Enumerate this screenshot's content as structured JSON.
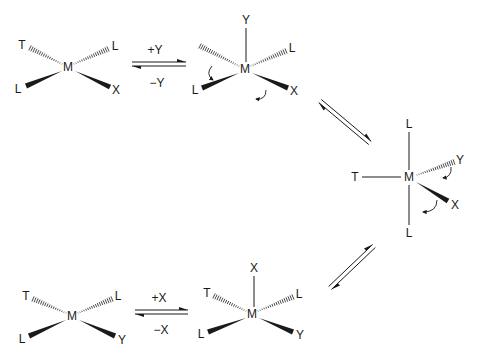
{
  "colors": {
    "ink": "#1a1a1a",
    "background": "#ffffff"
  },
  "structures": [
    {
      "id": "square-planar-1",
      "center": {
        "label": "M",
        "x": 68,
        "y": 67
      },
      "ligands": [
        {
          "label": "T",
          "x": 22,
          "y": 45,
          "bond": "hash",
          "from": [
            30,
            48
          ],
          "to": [
            62,
            64
          ]
        },
        {
          "label": "L",
          "x": 115,
          "y": 46,
          "bond": "hash",
          "from": [
            74,
            64
          ],
          "to": [
            108,
            49
          ]
        },
        {
          "label": "L",
          "x": 18,
          "y": 89,
          "bond": "wedge",
          "from": [
            62,
            71
          ],
          "to": [
            26,
            86
          ]
        },
        {
          "label": "X",
          "x": 116,
          "y": 90,
          "bond": "wedge",
          "from": [
            75,
            71
          ],
          "to": [
            110,
            87
          ]
        }
      ],
      "curved_arrows": []
    },
    {
      "id": "five-coordinate-2",
      "center": {
        "label": "M",
        "x": 245,
        "y": 69
      },
      "ligands": [
        {
          "label": "Y",
          "x": 246,
          "y": 20,
          "bond": "line",
          "from": [
            246,
            28
          ],
          "to": [
            246,
            62
          ]
        },
        {
          "label": "",
          "x": 200,
          "y": 47,
          "bond": "hash",
          "from": [
            200,
            46
          ],
          "to": [
            239,
            66
          ]
        },
        {
          "label": "L",
          "x": 292,
          "y": 48,
          "bond": "hash",
          "from": [
            251,
            66
          ],
          "to": [
            286,
            51
          ]
        },
        {
          "label": "L",
          "x": 195,
          "y": 90,
          "bond": "wedge",
          "from": [
            239,
            73
          ],
          "to": [
            202,
            88
          ]
        },
        {
          "label": "X",
          "x": 294,
          "y": 91,
          "bond": "wedge",
          "from": [
            252,
            73
          ],
          "to": [
            288,
            88
          ]
        }
      ],
      "curved_arrows": [
        {
          "path": "M 212 66 Q 205 74 213 80",
          "head": [
            213,
            80
          ]
        },
        {
          "path": "M 266 90 Q 266 100 256 99",
          "head": [
            256,
            99
          ]
        }
      ]
    },
    {
      "id": "trigonal-bipyramidal-3",
      "center": {
        "label": "M",
        "x": 409,
        "y": 177
      },
      "ligands": [
        {
          "label": "L",
          "x": 409,
          "y": 124,
          "bond": "line",
          "from": [
            409,
            132
          ],
          "to": [
            409,
            170
          ]
        },
        {
          "label": "T",
          "x": 355,
          "y": 177,
          "bond": "line",
          "from": [
            362,
            177
          ],
          "to": [
            401,
            177
          ]
        },
        {
          "label": "Y",
          "x": 460,
          "y": 160,
          "bond": "hash",
          "from": [
            417,
            175
          ],
          "to": [
            454,
            162
          ]
        },
        {
          "label": "X",
          "x": 455,
          "y": 205,
          "bond": "wedge",
          "from": [
            416,
            182
          ],
          "to": [
            448,
            201
          ]
        },
        {
          "label": "L",
          "x": 409,
          "y": 233,
          "bond": "line",
          "from": [
            409,
            185
          ],
          "to": [
            409,
            225
          ]
        }
      ],
      "curved_arrows": [
        {
          "path": "M 451 167 Q 452 177 443 178",
          "head": [
            443,
            178
          ]
        },
        {
          "path": "M 437 200 Q 437 212 423 212",
          "head": [
            423,
            212
          ]
        }
      ]
    },
    {
      "id": "five-coordinate-5",
      "center": {
        "label": "M",
        "x": 252,
        "y": 314
      },
      "ligands": [
        {
          "label": "X",
          "x": 254,
          "y": 268,
          "bond": "line",
          "from": [
            254,
            276
          ],
          "to": [
            254,
            307
          ]
        },
        {
          "label": "T",
          "x": 207,
          "y": 293,
          "bond": "hash",
          "from": [
            214,
            296
          ],
          "to": [
            246,
            311
          ]
        },
        {
          "label": "L",
          "x": 299,
          "y": 294,
          "bond": "hash",
          "from": [
            258,
            311
          ],
          "to": [
            293,
            297
          ]
        },
        {
          "label": "L",
          "x": 201,
          "y": 334,
          "bond": "wedge",
          "from": [
            246,
            318
          ],
          "to": [
            208,
            332
          ]
        },
        {
          "label": "Y",
          "x": 300,
          "y": 335,
          "bond": "wedge",
          "from": [
            259,
            318
          ],
          "to": [
            293,
            332
          ]
        }
      ],
      "curved_arrows": []
    },
    {
      "id": "square-planar-4",
      "center": {
        "label": "M",
        "x": 72,
        "y": 316
      },
      "ligands": [
        {
          "label": "T",
          "x": 26,
          "y": 296,
          "bond": "hash",
          "from": [
            33,
            299
          ],
          "to": [
            66,
            313
          ]
        },
        {
          "label": "L",
          "x": 118,
          "y": 296,
          "bond": "hash",
          "from": [
            78,
            313
          ],
          "to": [
            112,
            299
          ]
        },
        {
          "label": "L",
          "x": 22,
          "y": 339,
          "bond": "wedge",
          "from": [
            66,
            320
          ],
          "to": [
            29,
            336
          ]
        },
        {
          "label": "Y",
          "x": 122,
          "y": 340,
          "bond": "wedge",
          "from": [
            79,
            320
          ],
          "to": [
            115,
            336
          ]
        }
      ]
    }
  ],
  "equilibria": [
    {
      "id": "eq-add-Y",
      "top_label": "+Y",
      "bottom_label": "−Y",
      "from": [
        132,
        64
      ],
      "to": [
        186,
        64
      ],
      "top_label_pos": [
        155,
        50
      ],
      "bottom_label_pos": [
        157,
        83
      ]
    },
    {
      "id": "eq-pseudorotation-1",
      "top_label": "",
      "bottom_label": "",
      "from": [
        320,
        101
      ],
      "to": [
        370,
        143
      ]
    },
    {
      "id": "eq-pseudorotation-2",
      "top_label": "",
      "bottom_label": "",
      "from": [
        374,
        246
      ],
      "to": [
        330,
        288
      ]
    },
    {
      "id": "eq-add-X",
      "top_label": "+X",
      "bottom_label": "−X",
      "from": [
        135,
        312
      ],
      "to": [
        188,
        312
      ],
      "top_label_pos": [
        159,
        298
      ],
      "bottom_label_pos": [
        161,
        330
      ]
    }
  ]
}
